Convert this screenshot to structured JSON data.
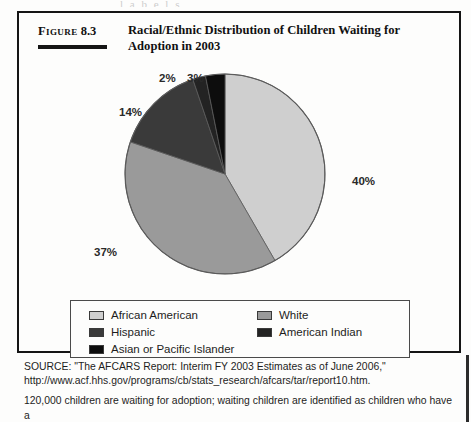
{
  "figure": {
    "label_prefix": "Figure",
    "label_number": "8.3",
    "title": "Racial/Ethnic Distribution of Children Waiting for Adoption in 2003"
  },
  "chart_data": {
    "type": "pie",
    "title": "Racial/Ethnic Distribution of Children Waiting for Adoption in 2003",
    "xlabel": "",
    "ylabel": "",
    "legend_position": "bottom",
    "grid": false,
    "start_angle_deg": 0,
    "direction": "clockwise",
    "categories": [
      "African American",
      "White",
      "Hispanic",
      "American Indian",
      "Asian or Pacific Islander"
    ],
    "values": [
      40,
      37,
      14,
      2,
      3
    ],
    "value_labels": [
      "40%",
      "37%",
      "14%",
      "2%",
      "3%"
    ],
    "slice_colors": [
      "#cfcfcf",
      "#9a9a9a",
      "#3a3a3a",
      "#232323",
      "#0d0d0d"
    ],
    "slices": [
      {
        "label": "African American",
        "value": 40,
        "display": "40%",
        "color": "#cfcfcf"
      },
      {
        "label": "White",
        "value": 37,
        "display": "37%",
        "color": "#9a9a9a"
      },
      {
        "label": "Hispanic",
        "value": 14,
        "display": "14%",
        "color": "#3a3a3a"
      },
      {
        "label": "American Indian",
        "value": 2,
        "display": "2%",
        "color": "#232323"
      },
      {
        "label": "Asian or Pacific Islander",
        "value": 3,
        "display": "3%",
        "color": "#0d0d0d"
      }
    ]
  },
  "legend": {
    "items": [
      {
        "label": "African American",
        "color": "#cfcfcf"
      },
      {
        "label": "Hispanic",
        "color": "#3a3a3a"
      },
      {
        "label": "Asian or Pacific Islander",
        "color": "#0d0d0d"
      },
      {
        "label": "White",
        "color": "#9a9a9a"
      },
      {
        "label": "American Indian",
        "color": "#232323"
      }
    ]
  },
  "source": {
    "text": "SOURCE: \"The AFCARS Report: Interim FY 2003 Estimates as of June 2006,\" http://www.acf.hhs.gov/programs/cb/stats_research/afcars/tar/report10.htm.",
    "note": "120,000 children are waiting for adoption; waiting children are identified as children who have a"
  },
  "ghost": {
    "clipped_line": "l    a    b    e    l    s"
  }
}
